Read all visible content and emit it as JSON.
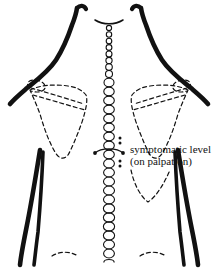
{
  "figure": {
    "name": "posterior-back-anatomy-diagram",
    "background_color": "#ffffff",
    "ink_color": "#111111",
    "width": 218,
    "height": 268
  },
  "annotations": {
    "symptomatic_level_line1": "symptomatic level",
    "symptomatic_level_line2": "(on palpation)"
  },
  "legend": {
    "marker_description": "palpation level marker",
    "dot_pairs": "paired dots above and below marker"
  },
  "anatomy": {
    "spine_label": "vertebral-column",
    "cervical_vertebrae_count": 8,
    "thoracic_lumbar_vertebrae_count": 17,
    "left_scapula_label": "left-scapula",
    "right_scapula_label": "right-scapula",
    "left_arm_label": "left-arm-outline",
    "right_arm_label": "right-arm-outline",
    "neck_label": "neck-outline",
    "iliac_crest_label": "iliac-crest-dashes"
  }
}
